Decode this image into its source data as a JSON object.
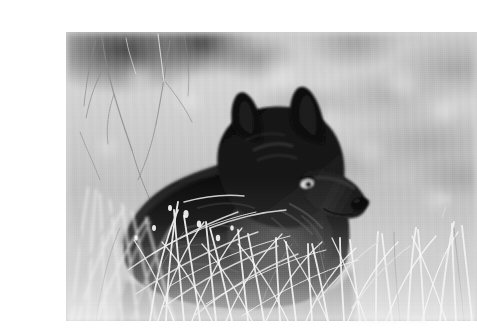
{
  "page": {
    "kind": "scanned-photograph-page",
    "background_color": "#ffffff",
    "width": 464,
    "height": 328
  },
  "photo": {
    "title": "Black wolf resting in dry grass",
    "medium": "black-and-white photograph",
    "color_mode": "monochrome",
    "frame": {
      "x": 26,
      "y": 16,
      "width": 411,
      "height": 289
    },
    "palette": {
      "subject_black": "#0d0d0d",
      "subject_shadow": "#1a1a1a",
      "fur_highlight": "#6e6e6e",
      "eye_light": "#e3e0d4",
      "nose_black": "#080808",
      "grass_bright": "#f2f2f2",
      "grass_mid": "#c9c9c9",
      "background_blur": "#d2d2d2",
      "background_dark_patch": "#3a3a3a"
    },
    "subject": {
      "animal": "wolf",
      "coat": "black",
      "pose": "lying down, head raised, facing right",
      "features": [
        "two erect pointed ears",
        "pale amber eye",
        "long dark muzzle with black nose",
        "thick ruff of fur around neck and shoulders"
      ]
    },
    "scene": {
      "foreground": "tall sunlit dry grass blades crossing in front of the animal",
      "midground": "wolf's dark body partially hidden by grass",
      "background": "heavily blurred bright meadow bokeh",
      "upper_left": "dark out-of-focus shrub mass with thin bare branches",
      "lighting": "bright backlit daylight"
    }
  },
  "artifacts": {
    "description": "faint scanner smudges and tick marks on the white page outside the photograph",
    "items": [
      {
        "name": "tick-mark",
        "position": "right margin, upper"
      },
      {
        "name": "smudge",
        "position": "right margin, upper"
      },
      {
        "name": "smudge",
        "position": "right margin, lower"
      },
      {
        "name": "smudge",
        "position": "bottom margin, right of center"
      },
      {
        "name": "smudge",
        "position": "bottom margin, far right"
      }
    ]
  }
}
